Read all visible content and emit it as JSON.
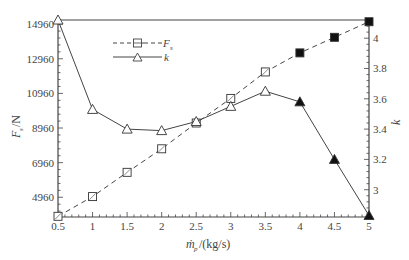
{
  "chart_data": {
    "type": "line",
    "title": "",
    "xlabel": "ṁ_p/(kg/s)",
    "ylabel_left": "F_s/N",
    "ylabel_right": "k",
    "x": [
      0.5,
      1,
      1.5,
      2,
      2.5,
      3,
      3.5,
      4,
      4.5,
      5
    ],
    "x_ticks": [
      "0.5",
      "1",
      "1.5",
      "2",
      "2.5",
      "3",
      "3.5",
      "4",
      "4.5",
      "5"
    ],
    "xlim": [
      0.5,
      5
    ],
    "y_left_ticks": [
      "4960",
      "6960",
      "8960",
      "10960",
      "12960",
      "14960"
    ],
    "y_left_lim": [
      3820,
      15200
    ],
    "y_right_ticks": [
      "3",
      "3.2",
      "3.4",
      "3.6",
      "3.8",
      "4"
    ],
    "y_right_lim": [
      2.82,
      4.12
    ],
    "grid": false,
    "legend_position": "upper-left",
    "series": [
      {
        "name": "F_s",
        "axis": "left",
        "line_style": "dashed",
        "marker": "square",
        "values": [
          3860,
          5000,
          6400,
          7760,
          9250,
          10670,
          12200,
          13300,
          14200,
          15100
        ],
        "filled_from_index": 7
      },
      {
        "name": "k",
        "axis": "right",
        "line_style": "solid",
        "marker": "triangle",
        "values": [
          4.12,
          3.53,
          3.4,
          3.39,
          3.45,
          3.55,
          3.65,
          3.58,
          3.2,
          2.83
        ],
        "filled_from_index": 7
      }
    ]
  },
  "legend": {
    "fs_label": "F",
    "fs_sub": "s",
    "k_label": "k"
  },
  "axes": {
    "xlabel_main": "ṁ",
    "xlabel_sub": "p",
    "xlabel_unit": "/(kg/s)",
    "ylabel_left_main": "F",
    "ylabel_left_sub": "s",
    "ylabel_left_unit": "/N",
    "ylabel_right": "k"
  }
}
